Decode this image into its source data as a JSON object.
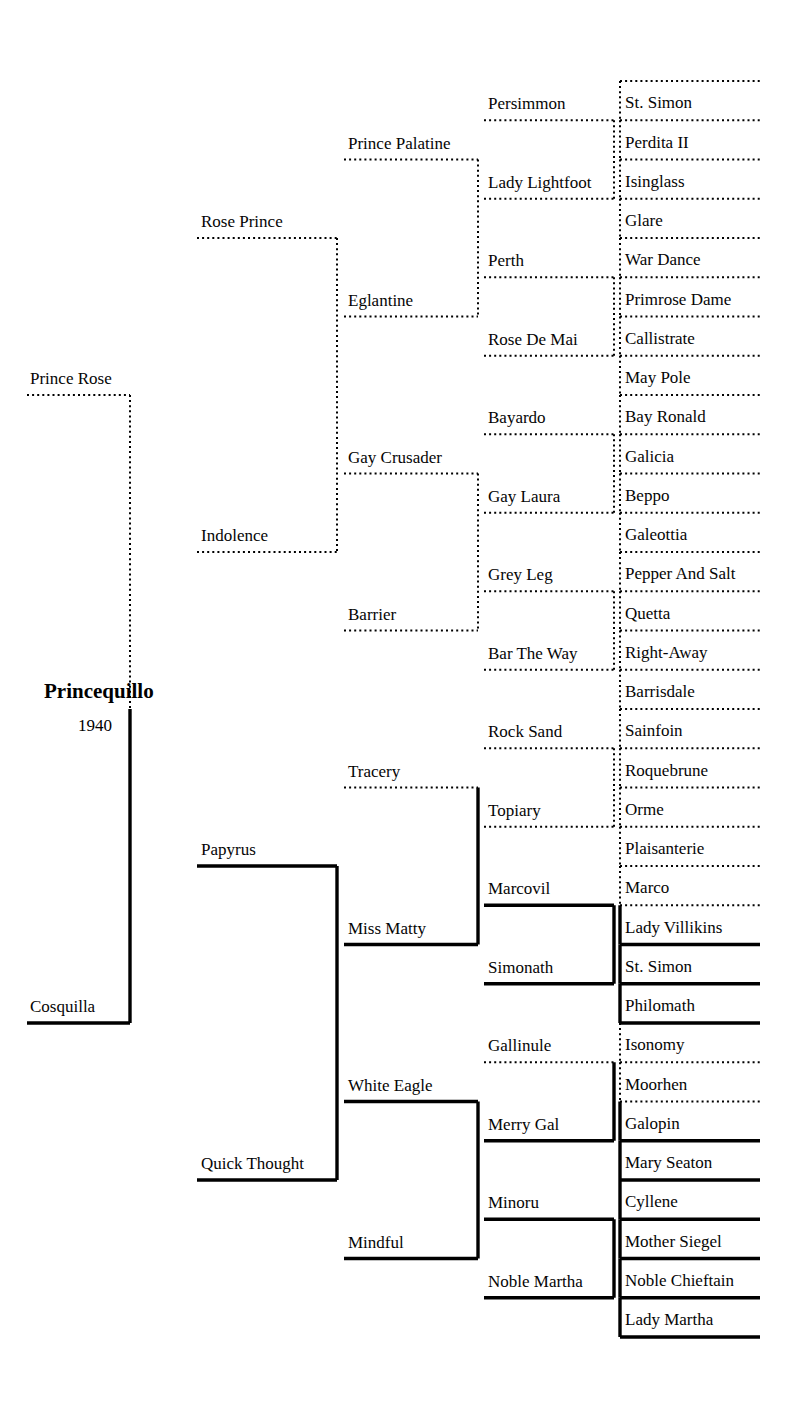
{
  "subject": {
    "name": "Princequillo",
    "year": "1940",
    "name_x": 44,
    "name_y": 679,
    "year_x": 78,
    "year_y": 716
  },
  "layout": {
    "col_x": [
      27,
      130,
      197,
      337,
      344,
      478,
      484,
      614,
      620,
      760
    ],
    "row_top": 81,
    "row_h": 39.25,
    "rows": 32,
    "sire_line_style": "dotted",
    "dam_line_style": "solid",
    "line_color": "#000000"
  },
  "generations": {
    "g1": [
      {
        "label": "Prince Rose",
        "row_span": [
          0,
          16
        ],
        "style": "dotted"
      },
      {
        "label": "Cosquilla",
        "row_span": [
          16,
          32
        ],
        "style": "solid"
      }
    ],
    "g2": [
      {
        "label": "Rose Prince",
        "row_span": [
          0,
          8
        ],
        "style": "dotted"
      },
      {
        "label": "Indolence",
        "row_span": [
          8,
          16
        ],
        "style": "dotted"
      },
      {
        "label": "Papyrus",
        "row_span": [
          16,
          24
        ],
        "style": "solid"
      },
      {
        "label": "Quick Thought",
        "row_span": [
          24,
          32
        ],
        "style": "solid"
      }
    ],
    "g3": [
      {
        "label": "Prince Palatine",
        "row_span": [
          0,
          4
        ],
        "style": "dotted"
      },
      {
        "label": "Eglantine",
        "row_span": [
          4,
          8
        ],
        "style": "dotted"
      },
      {
        "label": "Gay Crusader",
        "row_span": [
          8,
          12
        ],
        "style": "dotted"
      },
      {
        "label": "Barrier",
        "row_span": [
          12,
          16
        ],
        "style": "dotted"
      },
      {
        "label": "Tracery",
        "row_span": [
          16,
          20
        ],
        "style": "dotted"
      },
      {
        "label": "Miss Matty",
        "row_span": [
          20,
          24
        ],
        "style": "solid"
      },
      {
        "label": "White Eagle",
        "row_span": [
          24,
          28
        ],
        "style": "solid"
      },
      {
        "label": "Mindful",
        "row_span": [
          28,
          32
        ],
        "style": "solid"
      }
    ],
    "g4": [
      {
        "label": "Persimmon",
        "row_span": [
          0,
          2
        ],
        "style": "dotted"
      },
      {
        "label": "Lady Lightfoot",
        "row_span": [
          2,
          4
        ],
        "style": "dotted"
      },
      {
        "label": "Perth",
        "row_span": [
          4,
          6
        ],
        "style": "dotted"
      },
      {
        "label": "Rose De Mai",
        "row_span": [
          6,
          8
        ],
        "style": "dotted"
      },
      {
        "label": "Bayardo",
        "row_span": [
          8,
          10
        ],
        "style": "dotted"
      },
      {
        "label": "Gay Laura",
        "row_span": [
          10,
          12
        ],
        "style": "dotted"
      },
      {
        "label": "Grey Leg",
        "row_span": [
          12,
          14
        ],
        "style": "dotted"
      },
      {
        "label": "Bar The Way",
        "row_span": [
          14,
          16
        ],
        "style": "dotted"
      },
      {
        "label": "Rock Sand",
        "row_span": [
          16,
          18
        ],
        "style": "dotted"
      },
      {
        "label": "Topiary",
        "row_span": [
          18,
          20
        ],
        "style": "dotted"
      },
      {
        "label": "Marcovil",
        "row_span": [
          20,
          22
        ],
        "style": "solid"
      },
      {
        "label": "Simonath",
        "row_span": [
          22,
          24
        ],
        "style": "solid"
      },
      {
        "label": "Gallinule",
        "row_span": [
          24,
          26
        ],
        "style": "dotted"
      },
      {
        "label": "Merry Gal",
        "row_span": [
          26,
          28
        ],
        "style": "solid"
      },
      {
        "label": "Minoru",
        "row_span": [
          28,
          30
        ],
        "style": "solid"
      },
      {
        "label": "Noble Martha",
        "row_span": [
          30,
          32
        ],
        "style": "solid"
      }
    ],
    "g5": [
      {
        "label": "St. Simon",
        "row": 0,
        "style": "dotted"
      },
      {
        "label": "Perdita II",
        "row": 1,
        "style": "dotted"
      },
      {
        "label": "Isinglass",
        "row": 2,
        "style": "dotted"
      },
      {
        "label": "Glare",
        "row": 3,
        "style": "dotted"
      },
      {
        "label": "War Dance",
        "row": 4,
        "style": "dotted"
      },
      {
        "label": "Primrose Dame",
        "row": 5,
        "style": "dotted"
      },
      {
        "label": "Callistrate",
        "row": 6,
        "style": "dotted"
      },
      {
        "label": "May Pole",
        "row": 7,
        "style": "dotted"
      },
      {
        "label": "Bay Ronald",
        "row": 8,
        "style": "dotted"
      },
      {
        "label": "Galicia",
        "row": 9,
        "style": "dotted"
      },
      {
        "label": "Beppo",
        "row": 10,
        "style": "dotted"
      },
      {
        "label": "Galeottia",
        "row": 11,
        "style": "dotted"
      },
      {
        "label": "Pepper And Salt",
        "row": 12,
        "style": "dotted"
      },
      {
        "label": "Quetta",
        "row": 13,
        "style": "dotted"
      },
      {
        "label": "Right-Away",
        "row": 14,
        "style": "dotted"
      },
      {
        "label": "Barrisdale",
        "row": 15,
        "style": "dotted"
      },
      {
        "label": "Sainfoin",
        "row": 16,
        "style": "dotted"
      },
      {
        "label": "Roquebrune",
        "row": 17,
        "style": "dotted"
      },
      {
        "label": "Orme",
        "row": 18,
        "style": "dotted"
      },
      {
        "label": "Plaisanterie",
        "row": 19,
        "style": "dotted"
      },
      {
        "label": "Marco",
        "row": 20,
        "style": "dotted"
      },
      {
        "label": "Lady Villikins",
        "row": 21,
        "style": "solid"
      },
      {
        "label": "St. Simon",
        "row": 22,
        "style": "solid"
      },
      {
        "label": "Philomath",
        "row": 23,
        "style": "solid"
      },
      {
        "label": "Isonomy",
        "row": 24,
        "style": "dotted"
      },
      {
        "label": "Moorhen",
        "row": 25,
        "style": "dotted"
      },
      {
        "label": "Galopin",
        "row": 26,
        "style": "solid"
      },
      {
        "label": "Mary Seaton",
        "row": 27,
        "style": "solid"
      },
      {
        "label": "Cyllene",
        "row": 28,
        "style": "solid"
      },
      {
        "label": "Mother Siegel",
        "row": 29,
        "style": "solid"
      },
      {
        "label": "Noble Chieftain",
        "row": 30,
        "style": "solid"
      },
      {
        "label": "Lady Martha",
        "row": 31,
        "style": "solid"
      }
    ]
  },
  "chart_data": {
    "type": "diagram",
    "generations": 5,
    "total_ancestors": 62
  }
}
